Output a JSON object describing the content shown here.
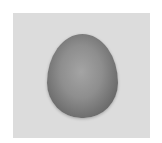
{
  "image": {
    "description": "Grayscale photograph of an egg on a light gray background",
    "subject": "egg",
    "colors": {
      "background": "#dcdcdc",
      "border": "#ffffff",
      "egg_center": "#a4a4a4",
      "egg_edge": "#3f3f3f"
    }
  }
}
